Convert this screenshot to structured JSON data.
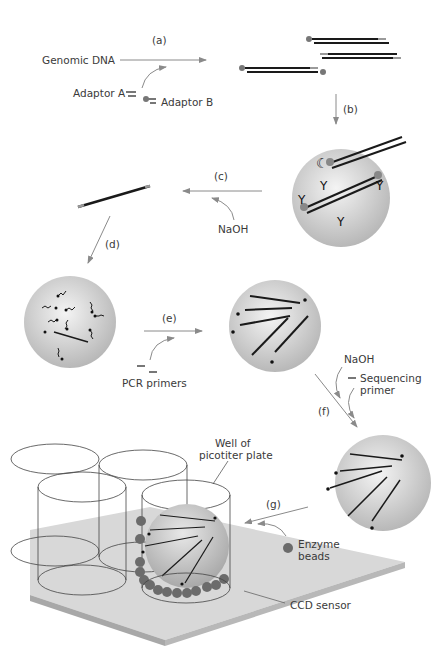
{
  "figure": {
    "steps": [
      {
        "id": "a",
        "label": "(a)"
      },
      {
        "id": "b",
        "label": "(b)"
      },
      {
        "id": "c",
        "label": "(c)"
      },
      {
        "id": "d",
        "label": "(d)"
      },
      {
        "id": "e",
        "label": "(e)"
      },
      {
        "id": "f",
        "label": "(f)"
      },
      {
        "id": "g",
        "label": "(g)"
      }
    ],
    "labels": {
      "genomic_dna": "Genomic DNA",
      "adaptor_a": "Adaptor A",
      "adaptor_b": "Adaptor B",
      "naoh_c": "NaOH",
      "pcr_primers": "PCR primers",
      "naoh_f": "NaOH",
      "sequencing_primer_1": "Sequencing",
      "sequencing_primer_2": "primer",
      "well_1": "Well of",
      "well_2": "picotiter plate",
      "enzyme_1": "Enzyme",
      "enzyme_2": "beads",
      "ccd_sensor": "CCD sensor"
    },
    "colors": {
      "arrow": "#8a8a8a",
      "dna": "#1a1a1a",
      "adaptor": "#9a9a9a",
      "bead_light": "#f2f2f2",
      "bead_dark": "#b5b5b5",
      "enzyme_bead": "#6b6b6b",
      "sensor": "#d8d8d8",
      "sensor_edge": "#a8a8a8"
    }
  }
}
